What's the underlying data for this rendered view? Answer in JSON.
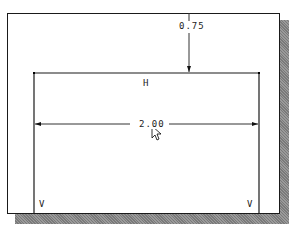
{
  "sketch": {
    "vertical_dimension": {
      "value": "0.75"
    },
    "horizontal_dimension": {
      "value": "2.00"
    },
    "constraints": {
      "top_line": "H",
      "left_line": "V",
      "right_line": "V"
    }
  },
  "colors": {
    "line": "#1a1a1a",
    "dimension": "#333333",
    "shadow": "#8a8a8a",
    "background": "#ffffff"
  }
}
